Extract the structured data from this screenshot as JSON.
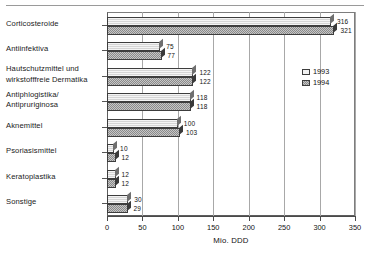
{
  "chart_data": {
    "type": "bar",
    "orientation": "horizontal",
    "title": "",
    "xlabel": "Mio. DDD",
    "ylabel": "",
    "xlim": [
      0,
      350
    ],
    "xticks": [
      0,
      50,
      100,
      150,
      200,
      250,
      300,
      350
    ],
    "grid": true,
    "legend_position": "inside-upper-right",
    "categories": [
      "Corticosteroide",
      "Antiinfektiva",
      "Hautschutzmittel und wirkstofffreie Dermatika",
      "Antiphlogistika/ Antipruriginosa",
      "Aknemittel",
      "Psoriasismittel",
      "Keratoplastika",
      "Sonstige"
    ],
    "category_lines": [
      [
        "Corticosteroide"
      ],
      [
        "Antiinfektiva"
      ],
      [
        "Hautschutzmittel und",
        "wirkstofffreie Dermatika"
      ],
      [
        "Antiphlogistika/",
        "Antipruriginosa"
      ],
      [
        "Aknemittel"
      ],
      [
        "Psoriasismittel"
      ],
      [
        "Keratoplastika"
      ],
      [
        "Sonstige"
      ]
    ],
    "series": [
      {
        "name": "1993",
        "color": "#d5d5d5",
        "values": [
          316,
          75,
          122,
          118,
          100,
          10,
          12,
          30
        ]
      },
      {
        "name": "1994",
        "color": "#9d9d9d",
        "values": [
          321,
          77,
          122,
          118,
          103,
          12,
          12,
          29
        ]
      }
    ]
  },
  "legend": {
    "items": [
      {
        "label": "1993"
      },
      {
        "label": "1994"
      }
    ]
  },
  "axis": {
    "x_title": "Mio. DDD",
    "tick_labels": [
      "0",
      "50",
      "100",
      "150",
      "200",
      "250",
      "300",
      "350"
    ]
  }
}
